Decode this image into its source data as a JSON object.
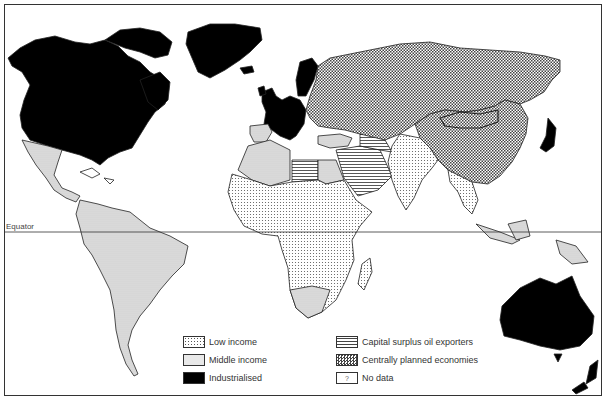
{
  "map": {
    "equator_label": "Equator",
    "categories": {
      "low_income": [
        "Central & West Africa",
        "East Africa",
        "South Asia",
        "Southeast Asia mainland",
        "Madagascar"
      ],
      "middle_income": [
        "Mexico & Central America",
        "South America",
        "North Africa",
        "Southern Africa",
        "Turkey",
        "Indonesia",
        "Papua New Guinea"
      ],
      "industrialised": [
        "North America",
        "Greenland",
        "Western Europe",
        "Japan",
        "Australia",
        "New Zealand"
      ],
      "capital_surplus_oil_exporters": [
        "Libya",
        "Saudi Arabia",
        "Gulf states"
      ],
      "centrally_planned_economies": [
        "USSR",
        "Mongolia",
        "China",
        "Eastern Europe"
      ]
    }
  },
  "legend": {
    "items": [
      {
        "key": "low_income",
        "label": "Low income",
        "swatch": "sw-low"
      },
      {
        "key": "middle_income",
        "label": "Middle income",
        "swatch": "sw-mid"
      },
      {
        "key": "industrialised",
        "label": "Industrialised",
        "swatch": "sw-ind"
      },
      {
        "key": "capital_surplus_oil_exporters",
        "label": "Capital surplus oil exporters",
        "swatch": "sw-oil"
      },
      {
        "key": "centrally_planned_economies",
        "label": "Centrally planned economies",
        "swatch": "sw-cpe"
      },
      {
        "key": "no_data",
        "label": "No data",
        "swatch": "sw-nodata",
        "glyph": "?"
      }
    ]
  },
  "colors": {
    "industrialised": "#000000",
    "border": "#333333",
    "background": "#ffffff"
  }
}
